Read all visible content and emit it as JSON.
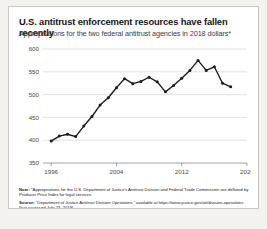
{
  "card": {
    "title": "U.S. antitrust enforcement resources have fallen recently",
    "subtitle": "Appropriations for the two federal antitrust agencies in 2018 dollars*"
  },
  "note": {
    "label": "Note:",
    "text": " *Appropriations for the U.S. Department of Justice's Antitrust Division and Federal Trade Commission are deflated by Producer Price Index for legal services."
  },
  "source": {
    "label": "Source:",
    "text": " \"Department of Justice Antitrust Division Operations,\" available at https://www.justice.gov/atr/division-operations [last accessed July 23, 2019]."
  },
  "chart_data": {
    "type": "line",
    "title": "U.S. antitrust enforcement resources have fallen recently",
    "subtitle": "Appropriations for the two federal antitrust agencies in 2018 dollars*",
    "xlabel": "",
    "ylabel": "",
    "xlim": [
      1995,
      2020
    ],
    "ylim": [
      350,
      600
    ],
    "yticks": [
      350,
      400,
      450,
      500,
      550,
      600
    ],
    "xticks": [
      1996,
      2004,
      2012,
      2020
    ],
    "ytick_labels": [
      "350",
      "400",
      "450",
      "500",
      "550",
      "600"
    ],
    "xtick_labels": [
      "1996",
      "2004",
      "2012",
      "2020"
    ],
    "grid": true,
    "legend": false,
    "markers": true,
    "series": [
      {
        "name": "Appropriations (millions of 2018 dollars)",
        "color": "#1a1a1a",
        "x": [
          1996,
          1997,
          1998,
          1999,
          2000,
          2001,
          2002,
          2003,
          2004,
          2005,
          2006,
          2007,
          2008,
          2009,
          2010,
          2011,
          2012,
          2013,
          2014,
          2015,
          2016,
          2017,
          2018
        ],
        "values": [
          398,
          409,
          413,
          408,
          431,
          452,
          477,
          493,
          515,
          535,
          524,
          529,
          538,
          528,
          506,
          520,
          536,
          553,
          575,
          553,
          561,
          525,
          517
        ]
      }
    ]
  }
}
